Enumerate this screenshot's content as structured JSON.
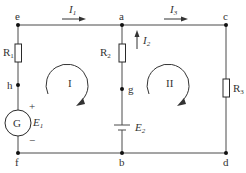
{
  "diagram": {
    "type": "circuit",
    "nodes": [
      {
        "id": "e",
        "label": "e"
      },
      {
        "id": "a",
        "label": "a"
      },
      {
        "id": "c",
        "label": "c"
      },
      {
        "id": "h",
        "label": "h"
      },
      {
        "id": "g",
        "label": "g"
      },
      {
        "id": "f",
        "label": "f"
      },
      {
        "id": "b",
        "label": "b"
      },
      {
        "id": "d",
        "label": "d"
      }
    ],
    "components": {
      "R1": {
        "base": "R",
        "sub": "1"
      },
      "R2": {
        "base": "R",
        "sub": "2"
      },
      "R3": {
        "base": "R",
        "sub": "3"
      },
      "G": {
        "label": "G"
      },
      "E1": {
        "base": "E",
        "sub": "1",
        "plus": "+",
        "minus": "−"
      },
      "E2": {
        "base": "E",
        "sub": "2"
      }
    },
    "currents": {
      "I1": {
        "base": "I",
        "sub": "1"
      },
      "I2": {
        "base": "I",
        "sub": "2"
      },
      "I3": {
        "base": "I",
        "sub": "3"
      }
    },
    "loops": {
      "loop1": {
        "label": "I"
      },
      "loop2": {
        "label": "II"
      }
    }
  }
}
